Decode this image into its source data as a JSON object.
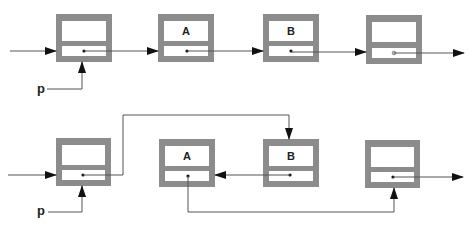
{
  "diagram": {
    "colors": {
      "node_border": "#8c8c8c",
      "node_fill": "#ffffff",
      "line": "#555555",
      "arrow": "#111111"
    },
    "pointer_label": "p",
    "before": {
      "nodes": [
        {
          "id": "b1",
          "label": "",
          "x": 56,
          "y": 14
        },
        {
          "id": "b2",
          "label": "A",
          "x": 158,
          "y": 14
        },
        {
          "id": "b3",
          "label": "B",
          "x": 263,
          "y": 14
        },
        {
          "id": "b4",
          "label": "",
          "x": 366,
          "y": 15
        }
      ]
    },
    "after": {
      "nodes": [
        {
          "id": "a1",
          "label": "",
          "x": 56,
          "y": 138
        },
        {
          "id": "a2",
          "label": "A",
          "x": 159,
          "y": 139
        },
        {
          "id": "a3",
          "label": "B",
          "x": 263,
          "y": 139
        },
        {
          "id": "a4",
          "label": "",
          "x": 365,
          "y": 140
        }
      ]
    }
  }
}
